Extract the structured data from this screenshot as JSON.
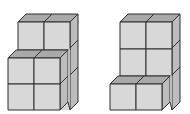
{
  "figures": [
    {
      "name": "left-block-structure",
      "description": "Two-column cube stack: back column 3 cubes high, front row 2 cubes high in front",
      "cube_counts": {
        "back_row_height": 3,
        "front_row_height": 2,
        "columns": 2
      }
    },
    {
      "name": "right-block-structure",
      "description": "Two-column cube stack: back column 3 cubes high, front row 1 cube high in front",
      "cube_counts": {
        "back_row_height": 3,
        "front_row_height": 1,
        "columns": 2
      }
    }
  ],
  "colors": {
    "front_face": "#d8d8d8",
    "top_face": "#a9a9a9",
    "side_face": "#bdbdbd",
    "stroke": "#2f2f2f",
    "background": "#ffffff"
  }
}
